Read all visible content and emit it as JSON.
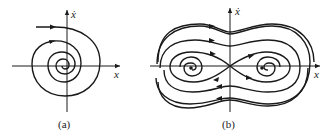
{
  "figure": {
    "panels": [
      {
        "id": "a",
        "caption": "(a)",
        "x_axis_label": "x",
        "y_axis_label": "ẋ",
        "description": "Phase portrait: single trajectory spiraling inward to a stable focus at the origin"
      },
      {
        "id": "b",
        "caption": "(b)",
        "x_axis_label": "x",
        "y_axis_label": "ẋ",
        "description": "Phase portrait: saddle at origin with figure-eight separatrix, two stable foci, outer trajectories spiraling inward"
      }
    ],
    "colors": {
      "stroke": "#1a1a1a",
      "background": "#ffffff"
    }
  }
}
